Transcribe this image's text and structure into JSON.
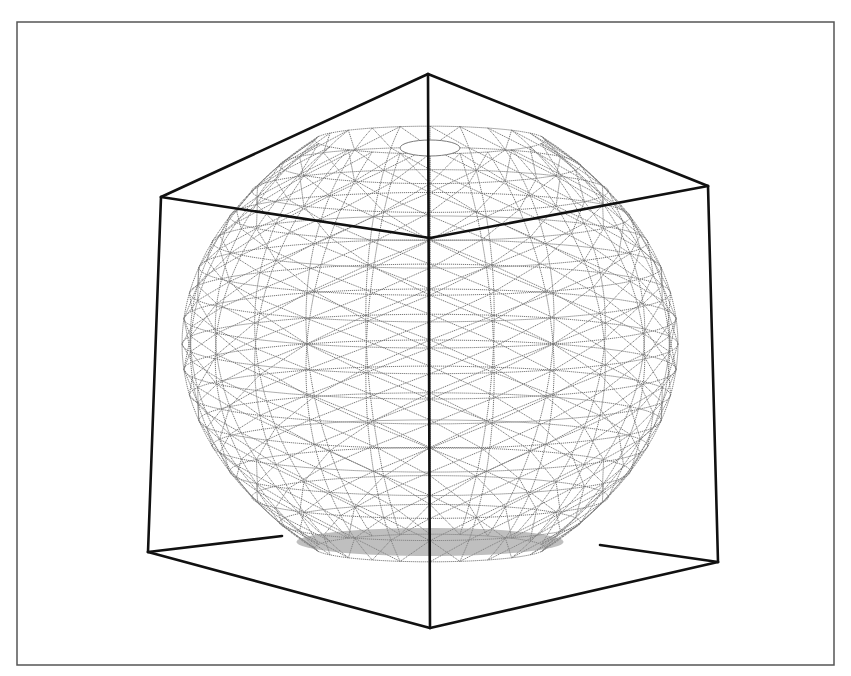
{
  "figure": {
    "colors": {
      "background": "#ffffff",
      "frame": "#555555",
      "cube": "#111111",
      "mesh": "#7a7a7a"
    },
    "frame": {
      "x": 17,
      "y": 22,
      "width": 817,
      "height": 643
    },
    "cube": {
      "vertices": {
        "top": [
          428,
          74
        ],
        "left_top": [
          161,
          197
        ],
        "right_top": [
          708,
          186
        ],
        "front_bottom": [
          430,
          628
        ],
        "left_bottom": [
          148,
          552
        ],
        "right_bottom": [
          718,
          562
        ],
        "back_top": [
          430,
          238
        ],
        "back_left_bottom": [
          282,
          536
        ],
        "back_right_bottom": [
          600,
          545
        ]
      },
      "edges": [
        [
          "top",
          "left_top"
        ],
        [
          "top",
          "right_top"
        ],
        [
          "top",
          "front_bottom"
        ],
        [
          "left_top",
          "left_bottom"
        ],
        [
          "right_top",
          "right_bottom"
        ],
        [
          "left_bottom",
          "front_bottom"
        ],
        [
          "right_bottom",
          "front_bottom"
        ],
        [
          "left_top",
          "back_top"
        ],
        [
          "right_top",
          "back_top"
        ],
        [
          "left_bottom",
          "back_left_bottom"
        ],
        [
          "right_bottom",
          "back_right_bottom"
        ]
      ]
    },
    "mesh": {
      "center": [
        430,
        340
      ],
      "radius_x": 248,
      "top_y": 140,
      "bottom_y": 548,
      "top_opening_rx": 30,
      "top_opening_ry": 8,
      "latitudes": 16,
      "longitudes": 24
    }
  }
}
